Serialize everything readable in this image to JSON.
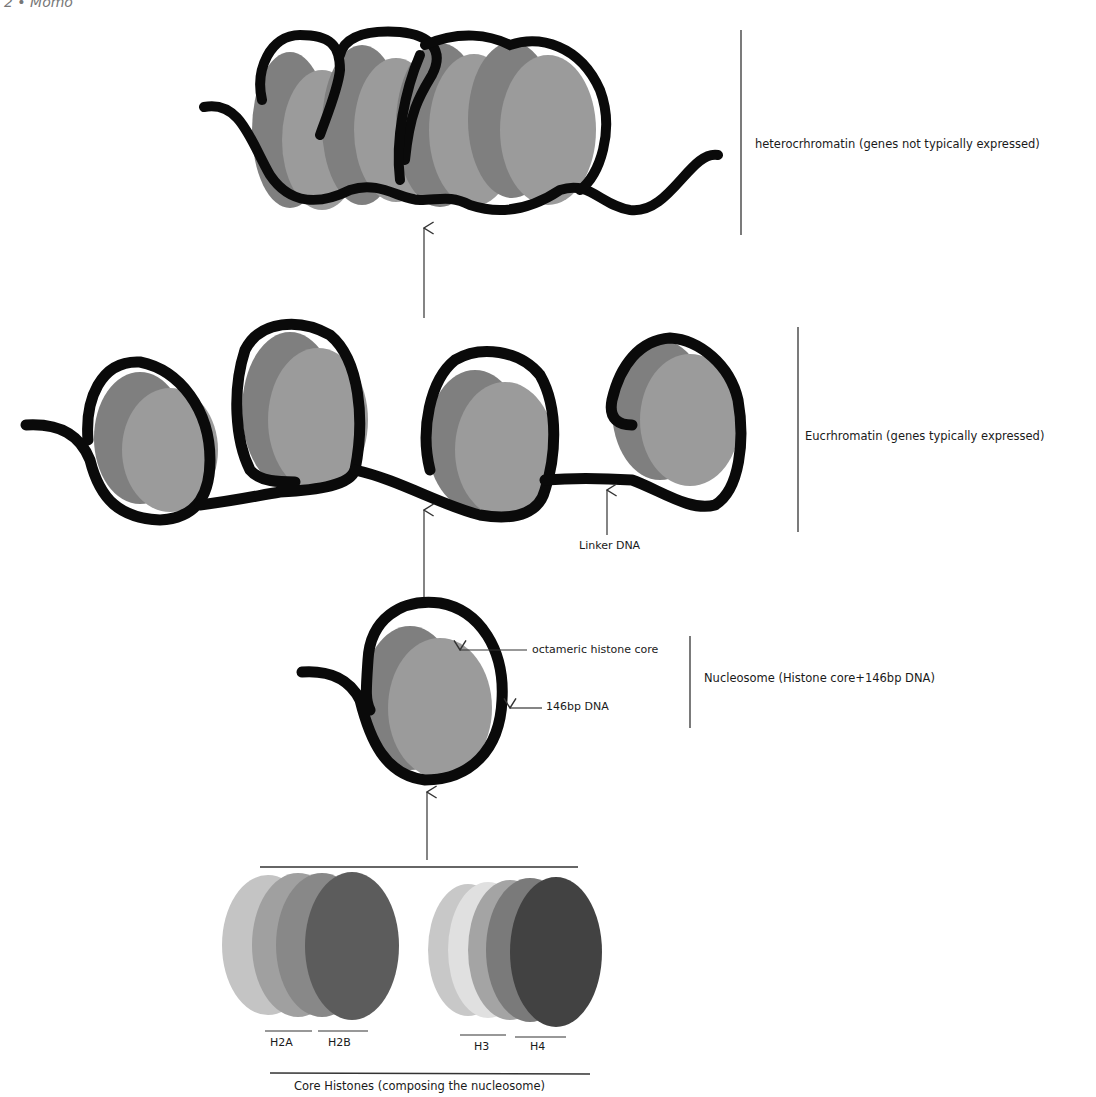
{
  "header": {
    "text": "2 • Momo"
  },
  "levels": {
    "heterochromatin": {
      "label": "heterocrhromatin (genes not typically expressed)",
      "nucleosome_count": 4
    },
    "euchromatin": {
      "label": "Eucrhromatin (genes typically expressed)",
      "nucleosome_count": 4,
      "linker_label": "Linker DNA"
    },
    "nucleosome": {
      "label": "Nucleosome (Histone core+146bp DNA)",
      "core_label": "octameric histone core",
      "dna_label": "146bp DNA"
    },
    "core_histones": {
      "label": "Core Histones (composing the nucleosome)",
      "histones": [
        "H2A",
        "H2B",
        "H3",
        "H4"
      ]
    }
  },
  "colors": {
    "dna": "#0a0a0a",
    "histone_back": "#7d7d7d",
    "histone_front": "#9a9a9a",
    "line": "#333333",
    "h_light": "#c4c4c4",
    "h_mid1": "#a2a2a2",
    "h_mid2": "#8a8a8a",
    "h_dark": "#5a5a5a",
    "h_darkest": "#3f3f3f",
    "h_pale": "#dcdcdc"
  }
}
